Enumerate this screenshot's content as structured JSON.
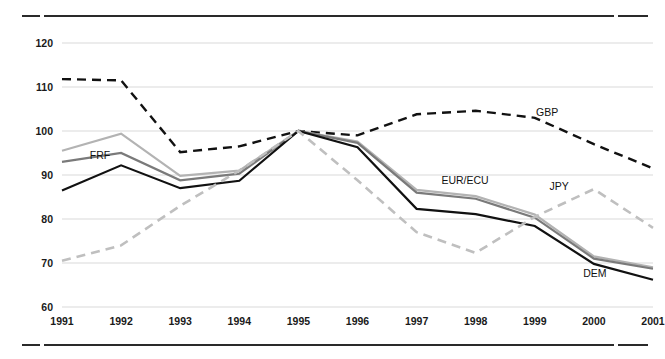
{
  "chart_data": {
    "type": "line",
    "title": "",
    "subtitle": "",
    "xlabel": "",
    "ylabel": "",
    "x": [
      1991,
      1992,
      1993,
      1994,
      1995,
      1996,
      1997,
      1998,
      1999,
      2000,
      2001
    ],
    "categories": [
      "1991",
      "1992",
      "1993",
      "1994",
      "1995",
      "1996",
      "1997",
      "1998",
      "1999",
      "2000",
      "2001"
    ],
    "xlim": [
      1991,
      2001
    ],
    "ylim": [
      60,
      120
    ],
    "yticks": [
      60,
      70,
      80,
      90,
      100,
      110,
      120
    ],
    "ytick_labels": [
      "60",
      "70",
      "80",
      "90",
      "100",
      "110",
      "120"
    ],
    "grid": "horizontal",
    "legend": "inline-labels",
    "series": [
      {
        "name": "GBP",
        "label": "GBP",
        "style": "dashed",
        "color": "#111111",
        "width": 2.4,
        "values": [
          111.8,
          111.5,
          95.2,
          96.5,
          100.0,
          99.0,
          103.8,
          104.6,
          103.0,
          97.0,
          91.5
        ]
      },
      {
        "name": "EUR/ECU",
        "label": "EUR/ECU",
        "style": "solid",
        "color": "#b3b3b3",
        "width": 2.2,
        "values": [
          95.5,
          99.4,
          89.8,
          91.0,
          100.0,
          97.6,
          86.6,
          85.2,
          81.0,
          71.5,
          69.0
        ]
      },
      {
        "name": "FRF",
        "label": "FRF",
        "style": "solid",
        "color": "#7a7a7a",
        "width": 2.2,
        "values": [
          93.0,
          95.0,
          88.8,
          90.3,
          100.0,
          97.3,
          86.0,
          84.6,
          80.3,
          71.0,
          68.7
        ]
      },
      {
        "name": "DEM",
        "label": "DEM",
        "style": "solid",
        "color": "#111111",
        "width": 2.2,
        "values": [
          86.5,
          92.2,
          87.0,
          88.7,
          100.0,
          96.3,
          82.3,
          81.1,
          78.4,
          69.8,
          66.2
        ]
      },
      {
        "name": "JPY",
        "label": "JPY",
        "style": "dashed",
        "color": "#bfbfbf",
        "width": 2.6,
        "values": [
          70.5,
          74.0,
          83.0,
          91.0,
          100.0,
          88.8,
          77.0,
          72.3,
          80.5,
          86.8,
          78.0
        ]
      }
    ],
    "series_labels": [
      {
        "text": "FRF",
        "x": 1991.47,
        "y": 93.6
      },
      {
        "text": "EUR/ECU",
        "x": 1997.42,
        "y": 87.9
      },
      {
        "text": "JPY",
        "x": 1999.25,
        "y": 86.6
      },
      {
        "text": "GBP",
        "x": 1999.02,
        "y": 103.3
      },
      {
        "text": "DEM",
        "x": 1999.82,
        "y": 66.8
      }
    ]
  },
  "frame": {
    "top_rule_name": "top-divider",
    "bottom_rule_name": "bottom-divider"
  }
}
